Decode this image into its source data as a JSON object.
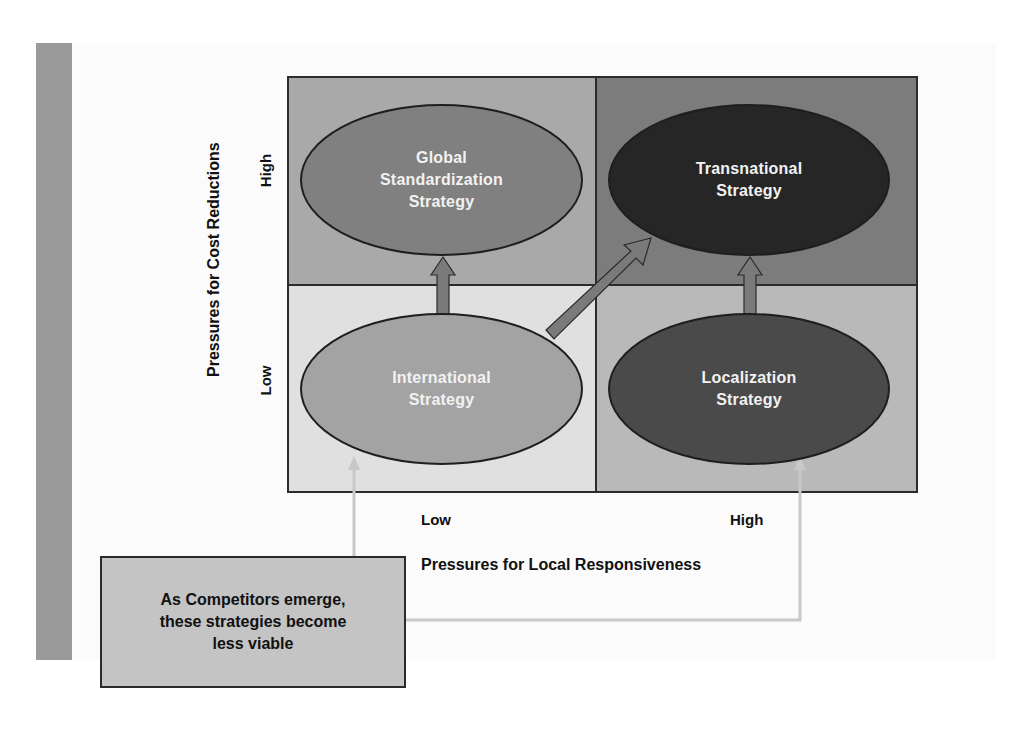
{
  "colors": {
    "side_bar": "#9a9a9a",
    "panel_bg": "#fbfbfb",
    "quad_top_left": "#a9a9a9",
    "quad_top_right": "#7c7c7c",
    "quad_bottom_left": "#e0e0e0",
    "quad_bottom_right": "#b9b9b9",
    "ellipse_global": "#808080",
    "ellipse_transnational": "#262626",
    "ellipse_international": "#a3a3a3",
    "ellipse_localization": "#4a4a4a",
    "arrow_fill": "#7a7a7a",
    "connector": "#c8c8c8",
    "callout_bg": "#c4c4c4"
  },
  "y_axis": {
    "title": "Pressures for Cost Reductions",
    "high_label": "High",
    "low_label": "Low"
  },
  "x_axis": {
    "title": "Pressures for Local Responsiveness",
    "low_label": "Low",
    "high_label": "High"
  },
  "strategies": {
    "global": "Global\nStandardization\nStrategy",
    "transnational": "Transnational\nStrategy",
    "international": "International\nStrategy",
    "localization": "Localization\nStrategy"
  },
  "callout": {
    "text": "As Competitors emerge,\nthese strategies become\nless viable"
  },
  "arrows": [
    {
      "from": "International Strategy",
      "to": "Global Standardization Strategy"
    },
    {
      "from": "International Strategy",
      "to": "Transnational Strategy"
    },
    {
      "from": "Localization Strategy",
      "to": "Transnational Strategy"
    }
  ]
}
